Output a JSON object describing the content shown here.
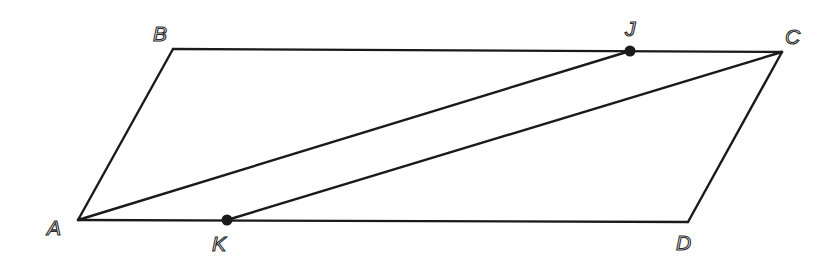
{
  "diagram": {
    "shape": "parallelogram",
    "stroke_color": "#1a1a1a",
    "background": "#ffffff",
    "vertices": {
      "A": {
        "label": "A",
        "x": 78,
        "y": 220,
        "label_x": 47,
        "label_y": 235
      },
      "B": {
        "label": "B",
        "x": 173,
        "y": 49,
        "label_x": 153,
        "label_y": 41
      },
      "C": {
        "label": "C",
        "x": 782,
        "y": 52,
        "label_x": 785,
        "label_y": 44
      },
      "D": {
        "label": "D",
        "x": 688,
        "y": 222,
        "label_x": 676,
        "label_y": 250
      },
      "J": {
        "label": "J",
        "x": 630,
        "y": 51,
        "label_x": 625,
        "label_y": 36
      },
      "K": {
        "label": "K",
        "x": 227,
        "y": 220,
        "label_x": 212,
        "label_y": 251
      }
    },
    "segments": [
      {
        "name": "AB",
        "from": "A",
        "to": "B"
      },
      {
        "name": "BC",
        "from": "B",
        "to": "C"
      },
      {
        "name": "CD",
        "from": "C",
        "to": "D"
      },
      {
        "name": "DA",
        "from": "D",
        "to": "A"
      },
      {
        "name": "AJ",
        "from": "A",
        "to": "J"
      },
      {
        "name": "KC",
        "from": "K",
        "to": "C"
      }
    ],
    "marked_points": [
      "J",
      "K"
    ],
    "point_on_segment": {
      "J": "BC",
      "K": "AD"
    }
  }
}
